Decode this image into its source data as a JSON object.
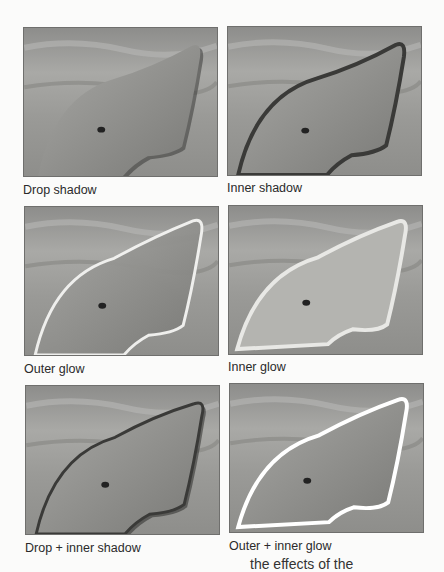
{
  "figure": {
    "panels": [
      {
        "id": "drop-shadow",
        "caption": "Drop shadow",
        "effect": "drop"
      },
      {
        "id": "inner-shadow",
        "caption": "Inner shadow",
        "effect": "inner"
      },
      {
        "id": "outer-glow",
        "caption": "Outer glow",
        "effect": "outerglow"
      },
      {
        "id": "inner-glow",
        "caption": "Inner glow",
        "effect": "innerglow"
      },
      {
        "id": "drop-inner-shadow",
        "caption": "Drop + inner shadow",
        "effect": "dropinner"
      },
      {
        "id": "outer-inner-glow",
        "caption": "Outer + inner glow",
        "effect": "outerinnerglow"
      }
    ],
    "clipped_text": "the effects of the"
  }
}
